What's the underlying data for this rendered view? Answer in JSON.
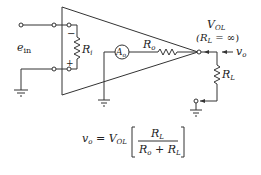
{
  "diagram": {
    "labels": {
      "input_voltage": "e",
      "input_voltage_sub": "in",
      "input_resistance": "R",
      "input_resistance_sub": "i",
      "minus_sign": "−",
      "plus_sign": "+",
      "gain_source": "A",
      "gain_source_sub": "o",
      "output_resistance": "R",
      "output_resistance_sub": "o",
      "open_loop_voltage": "V",
      "open_loop_voltage_sub": "OL",
      "condition_open": "(R",
      "condition_sub": "L",
      "condition_rest": " = ∞)",
      "output_voltage": "v",
      "output_voltage_sub": "o",
      "load_resistance": "R",
      "load_resistance_sub": "L"
    },
    "formula": {
      "lhs": "v",
      "lhs_sub": "o",
      "equals": " = ",
      "coef": "V",
      "coef_sub": "OL",
      "numerator": "R",
      "numerator_sub": "L",
      "denominator_a": "R",
      "denominator_a_sub": "o",
      "denominator_plus": " + ",
      "denominator_b": "R",
      "denominator_b_sub": "L"
    },
    "components": [
      {
        "id": "Ri",
        "type": "resistor",
        "label": "Ri"
      },
      {
        "id": "Ao",
        "type": "dependent-source",
        "label": "Ao"
      },
      {
        "id": "Ro",
        "type": "resistor",
        "label": "Ro"
      },
      {
        "id": "RL",
        "type": "resistor",
        "label": "RL"
      }
    ]
  }
}
